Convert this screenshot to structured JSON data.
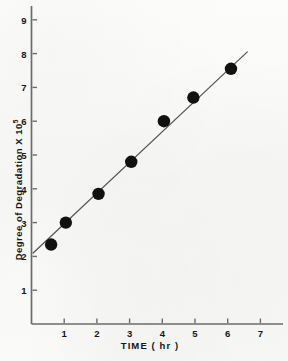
{
  "chart_data": {
    "type": "scatter",
    "title": "",
    "xlabel": "TIME  ( hr )",
    "ylabel": "Degree of  Degradation X 10",
    "ylabel_exponent": "5",
    "ylabel_full": "Degree of Degradation X 10^5",
    "xlim": [
      0,
      7.5
    ],
    "ylim": [
      0,
      9.6
    ],
    "xticks": [
      1,
      2,
      3,
      4,
      5,
      6,
      7
    ],
    "yticks": [
      1,
      2,
      3,
      4,
      5,
      6,
      7,
      8,
      9
    ],
    "xtick_labels": [
      "1",
      "2",
      "3",
      "4",
      "5",
      "6",
      "7"
    ],
    "ytick_labels": [
      "1",
      "2",
      "3",
      "4",
      "5",
      "6",
      "7",
      "8",
      "9"
    ],
    "grid": false,
    "legend": "none",
    "marker": "filled-circle",
    "marker_color": "#111111",
    "line_color": "#555555",
    "axis_color": "#6b6b6b",
    "background_color": "#fbfbfa",
    "points": [
      {
        "x": 0.6,
        "y": 2.35
      },
      {
        "x": 1.05,
        "y": 3.0
      },
      {
        "x": 2.05,
        "y": 3.85
      },
      {
        "x": 3.05,
        "y": 4.8
      },
      {
        "x": 4.05,
        "y": 6.0
      },
      {
        "x": 4.95,
        "y": 6.7
      },
      {
        "x": 6.1,
        "y": 7.55
      }
    ],
    "x": [
      0.6,
      1.05,
      2.05,
      3.05,
      4.05,
      4.95,
      6.1
    ],
    "values": [
      2.35,
      3.0,
      3.85,
      4.8,
      6.0,
      6.7,
      7.55
    ],
    "series": [
      {
        "name": "Degree of Degradation",
        "x": [
          0.6,
          1.05,
          2.05,
          3.05,
          4.05,
          4.95,
          6.1
        ],
        "values": [
          2.35,
          3.0,
          3.85,
          4.8,
          6.0,
          6.7,
          7.55
        ]
      }
    ],
    "fit_line": {
      "x_start": 0.05,
      "y_start": 2.1,
      "x_end": 6.6,
      "y_end": 8.05
    },
    "annotations": []
  }
}
